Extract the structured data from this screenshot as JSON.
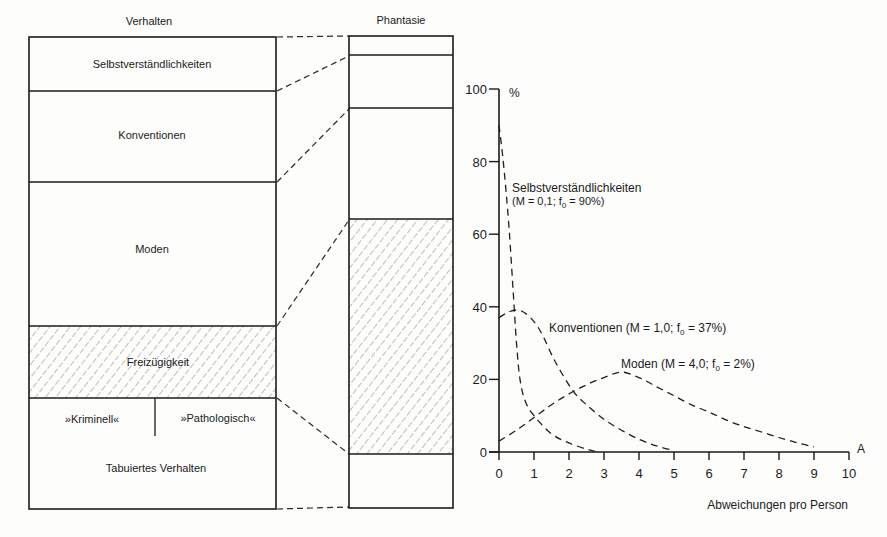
{
  "figure": {
    "left_column": {
      "title": "Verhalten",
      "segments": [
        {
          "label": "Selbstverständlichkeiten",
          "hatched": false
        },
        {
          "label": "Konventionen",
          "hatched": false
        },
        {
          "label": "Moden",
          "hatched": false
        },
        {
          "label": "Freizügigkeit",
          "hatched": true
        },
        {
          "label": "Tabuiertes Verhalten",
          "hatched": false,
          "sublabels": [
            "»Kriminell«",
            "»Pathologisch«"
          ]
        }
      ]
    },
    "right_column": {
      "title": "Phantasie",
      "segments": [
        {
          "hatched": false
        },
        {
          "hatched": false
        },
        {
          "hatched": false
        },
        {
          "hatched": true
        },
        {
          "hatched": false
        }
      ]
    }
  },
  "chart_data": {
    "type": "line",
    "title": "",
    "xlabel": "Abweichungen pro Person",
    "x_axis_symbol": "A",
    "ylabel": "%",
    "xlim": [
      0,
      10
    ],
    "ylim": [
      0,
      100
    ],
    "xticks": [
      0,
      1,
      2,
      3,
      4,
      5,
      6,
      7,
      8,
      9,
      10
    ],
    "yticks": [
      0,
      20,
      40,
      60,
      80,
      100
    ],
    "grid": false,
    "legend": "inline annotations next to curves",
    "line_style": "dashed",
    "series": [
      {
        "name": "Selbstverständlichkeiten",
        "M": "0,1",
        "f0": "90%",
        "annotation": {
          "line1": "Selbstverständlichkeiten",
          "pre": "(M = 0,1; f",
          "sub": "0",
          "post": " = 90%)"
        },
        "x": [
          0,
          0.1,
          0.2,
          0.3,
          0.4,
          0.5,
          0.6,
          0.75,
          1.0,
          1.5,
          2.0,
          2.5,
          2.8
        ],
        "y": [
          90,
          82,
          72,
          60,
          45,
          30,
          20,
          14,
          10,
          5,
          2.5,
          0.8,
          0
        ]
      },
      {
        "name": "Konventionen",
        "M": "1,0",
        "f0": "37%",
        "annotation": {
          "pre": "Konventionen (M = 1,0; f",
          "sub": "0",
          "post": " = 37%)"
        },
        "x": [
          0,
          0.3,
          0.6,
          0.9,
          1.2,
          1.6,
          2.1,
          2.5,
          3.0,
          3.5,
          4.0,
          4.5,
          5.0
        ],
        "y": [
          37,
          38.7,
          39,
          37,
          33,
          25,
          17,
          13,
          9,
          6,
          3.5,
          1.7,
          0.4
        ]
      },
      {
        "name": "Moden",
        "M": "4,0",
        "f0": "2%",
        "annotation": {
          "pre": "Moden (M = 4,0; f",
          "sub": "0",
          "post": " = 2%)"
        },
        "x": [
          0,
          0.5,
          1.0,
          1.5,
          2.0,
          2.5,
          3.0,
          3.5,
          4.0,
          4.5,
          5.0,
          5.5,
          6.0,
          6.5,
          7.0,
          7.5,
          8.0,
          8.5,
          9.0
        ],
        "y": [
          3,
          6,
          9.5,
          13,
          16,
          18.5,
          20.5,
          22,
          20.5,
          18,
          15.5,
          13,
          11,
          8.8,
          7,
          5.5,
          4,
          2.6,
          1.4
        ]
      }
    ]
  }
}
